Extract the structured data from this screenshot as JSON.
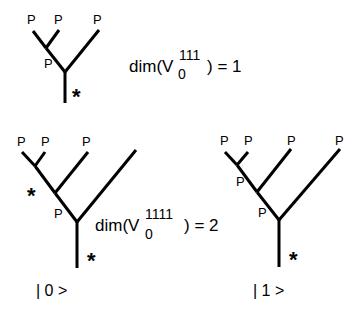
{
  "trees": [
    {
      "id": "tree-1",
      "leaf_labels": [
        "P",
        "P",
        "P"
      ],
      "internal_labels": [
        "P"
      ],
      "root_mark": "*",
      "equation": {
        "prefix": "dim(V",
        "subscript": "0",
        "superscript": "111",
        "suffix": ") = 1"
      }
    },
    {
      "id": "tree-2",
      "leaf_labels": [
        "P",
        "P",
        "P"
      ],
      "internal_labels": [
        "*",
        "P"
      ],
      "root_mark": "*",
      "ket": "| 0 >",
      "equation": {
        "prefix": "dim(V",
        "subscript": "0",
        "superscript": "1111",
        "suffix": ") = 2"
      }
    },
    {
      "id": "tree-3",
      "leaf_labels": [
        "P",
        "P",
        "P",
        "P"
      ],
      "internal_labels": [
        "P",
        "P"
      ],
      "root_mark": "*",
      "ket": "| 1 >"
    }
  ]
}
